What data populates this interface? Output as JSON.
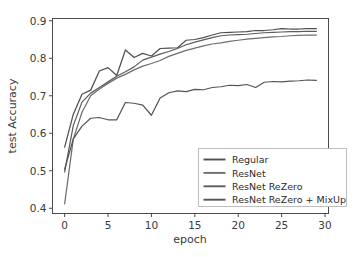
{
  "chart_data": {
    "type": "line",
    "title": "",
    "xlabel": "epoch",
    "ylabel": "test Accuracy",
    "xlim": [
      -1.4,
      30.4
    ],
    "ylim": [
      0.386,
      0.906
    ],
    "xticks": [
      0,
      5,
      10,
      15,
      20,
      25,
      30
    ],
    "xtick_labels": [
      "0",
      "5",
      "10",
      "15",
      "20",
      "25",
      "30"
    ],
    "yticks": [
      0.4,
      0.5,
      0.6,
      0.7,
      0.8,
      0.9
    ],
    "ytick_labels": [
      "0.4",
      "0.5",
      "0.6",
      "0.7",
      "0.8",
      "0.9"
    ],
    "grid": false,
    "legend_position": "lower right",
    "x": [
      0,
      1,
      2,
      3,
      4,
      5,
      6,
      7,
      8,
      9,
      10,
      11,
      12,
      13,
      14,
      15,
      16,
      17,
      18,
      19,
      20,
      21,
      22,
      23,
      24,
      25,
      26,
      27,
      28,
      29
    ],
    "series": [
      {
        "name": "Regular",
        "color": "#4f4f4f",
        "values": [
          0.563,
          0.651,
          0.704,
          0.715,
          0.766,
          0.775,
          0.754,
          0.822,
          0.802,
          0.813,
          0.806,
          0.826,
          0.827,
          0.828,
          0.848,
          0.85,
          0.855,
          0.862,
          0.868,
          0.869,
          0.87,
          0.871,
          0.874,
          0.874,
          0.876,
          0.879,
          0.878,
          0.878,
          0.879,
          0.879
        ]
      },
      {
        "name": "ResNet",
        "color": "#6e6e6e",
        "values": [
          0.412,
          0.585,
          0.656,
          0.7,
          0.718,
          0.733,
          0.747,
          0.757,
          0.769,
          0.779,
          0.786,
          0.794,
          0.805,
          0.813,
          0.821,
          0.827,
          0.833,
          0.838,
          0.841,
          0.845,
          0.848,
          0.851,
          0.853,
          0.855,
          0.857,
          0.858,
          0.86,
          0.861,
          0.862,
          0.862
        ]
      },
      {
        "name": "ResNet ReZero",
        "color": "#5c5c5c",
        "values": [
          0.497,
          0.621,
          0.683,
          0.707,
          0.722,
          0.737,
          0.752,
          0.764,
          0.777,
          0.795,
          0.803,
          0.811,
          0.818,
          0.826,
          0.836,
          0.843,
          0.849,
          0.855,
          0.86,
          0.862,
          0.863,
          0.864,
          0.866,
          0.868,
          0.869,
          0.87,
          0.871,
          0.871,
          0.872,
          0.872
        ]
      },
      {
        "name": "ResNet ReZero + MixUp",
        "color": "#555555",
        "values": [
          0.504,
          0.585,
          0.619,
          0.64,
          0.642,
          0.636,
          0.636,
          0.682,
          0.68,
          0.675,
          0.648,
          0.694,
          0.708,
          0.713,
          0.711,
          0.717,
          0.716,
          0.722,
          0.724,
          0.728,
          0.727,
          0.73,
          0.722,
          0.736,
          0.738,
          0.737,
          0.739,
          0.74,
          0.742,
          0.741
        ]
      }
    ]
  },
  "legend": {
    "entries": [
      {
        "label": "Regular"
      },
      {
        "label": "ResNet"
      },
      {
        "label": "ResNet ReZero"
      },
      {
        "label": "ResNet ReZero + MixUp"
      }
    ]
  }
}
